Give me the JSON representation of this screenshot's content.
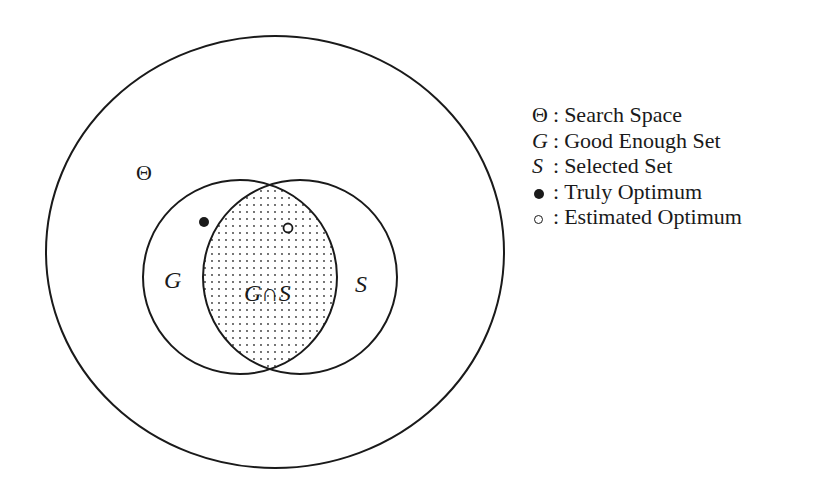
{
  "diagram": {
    "type": "venn",
    "outer_label": "Θ",
    "set_g_label": "G",
    "set_s_label": "S",
    "intersection_label": "G∩S",
    "colors": {
      "stroke": "#1a1a1a",
      "background": "#ffffff",
      "dots": "#333333"
    },
    "markers": [
      {
        "name": "truly-optimum",
        "style": "filled",
        "region": "G only"
      },
      {
        "name": "estimated-optimum",
        "style": "hollow",
        "region": "G∩S"
      }
    ]
  },
  "legend": {
    "items": [
      {
        "symbol": "Θ",
        "label": "Search Space"
      },
      {
        "symbol": "G",
        "label": "Good Enough Set"
      },
      {
        "symbol": "S",
        "label": "Selected Set"
      },
      {
        "symbol": "●",
        "label": "Truly Optimum"
      },
      {
        "symbol": "○",
        "label": "Estimated Optimum"
      }
    ],
    "separator": ":"
  }
}
